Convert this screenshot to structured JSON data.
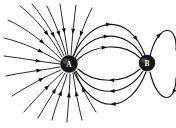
{
  "figure": {
    "background_color": "#ffffff",
    "line_color": "#1a1a1a",
    "width": 176,
    "height": 128
  },
  "charges": [
    {
      "id": "charge-a",
      "label": "A",
      "cx": 69,
      "cy": 64,
      "r": 8.5,
      "fill": "#161616",
      "label_color": "#f2f2f2",
      "polarity": "negative",
      "description": "Left charge; field lines converge inward"
    },
    {
      "id": "charge-b",
      "label": "B",
      "cx": 147,
      "cy": 63,
      "r": 8.0,
      "fill": "#161616",
      "label_color": "#f2f2f2",
      "polarity": "positive",
      "description": "Right charge; field lines emerge and loop back to A"
    }
  ],
  "chart_data": {
    "type": "line",
    "xlabel": "",
    "ylabel": "",
    "xlim": [
      0,
      176
    ],
    "ylim": [
      0,
      128
    ],
    "grid": false,
    "legend": "none",
    "annotations": [
      "A",
      "B"
    ],
    "series": [
      {
        "name": "radial-in-1",
        "group": "radial-to-A",
        "arrow_direction": "toward-A",
        "path": "M 20 6 C 36 18, 52 38, 62 57",
        "arrows": [
          {
            "t": 0.62,
            "dir": "toward-A"
          }
        ]
      },
      {
        "name": "radial-in-2",
        "group": "radial-to-A",
        "arrow_direction": "toward-A",
        "path": "M 32 4 C 44 18, 56 38, 64 56",
        "arrows": [
          {
            "t": 0.66,
            "dir": "toward-A"
          }
        ]
      },
      {
        "name": "radial-in-3",
        "group": "radial-to-A",
        "arrow_direction": "toward-A",
        "path": "M 47 6 C 54 20, 62 40, 66 55",
        "arrows": [
          {
            "t": 0.62,
            "dir": "toward-A"
          }
        ]
      },
      {
        "name": "radial-in-4",
        "group": "radial-to-A",
        "arrow_direction": "toward-A",
        "path": "M 60 4 C 62 20, 66 40, 68 55",
        "arrows": [
          {
            "t": 0.58,
            "dir": "toward-A"
          }
        ]
      },
      {
        "name": "radial-in-5",
        "group": "radial-to-A",
        "arrow_direction": "toward-A",
        "path": "M 76 5 C 74 20, 72 40, 71 55",
        "arrows": [
          {
            "t": 0.58,
            "dir": "toward-A"
          }
        ]
      },
      {
        "name": "radial-in-6",
        "group": "radial-to-A",
        "arrow_direction": "toward-A",
        "path": "M 92 8 C 85 22, 78 40, 74 56",
        "arrows": [
          {
            "t": 0.6,
            "dir": "toward-A"
          }
        ]
      },
      {
        "name": "radial-in-7",
        "group": "radial-to-A",
        "arrow_direction": "toward-A",
        "path": "M 8 20 C 26 28, 46 44, 61 59",
        "arrows": [
          {
            "t": 0.66,
            "dir": "toward-A"
          }
        ]
      },
      {
        "name": "radial-in-8",
        "group": "radial-to-A",
        "arrow_direction": "toward-A",
        "path": "M 4 38 C 22 42, 44 52, 60 62",
        "arrows": [
          {
            "t": 0.68,
            "dir": "toward-A"
          }
        ]
      },
      {
        "name": "radial-in-9",
        "group": "radial-to-A",
        "arrow_direction": "toward-A",
        "path": "M 4 56 C 22 58, 42 62, 60 64",
        "arrows": [
          {
            "t": 0.66,
            "dir": "toward-A"
          }
        ]
      },
      {
        "name": "radial-in-10",
        "group": "radial-to-A",
        "arrow_direction": "toward-A",
        "path": "M 6 76 C 24 72, 44 70, 60 67",
        "arrows": [
          {
            "t": 0.66,
            "dir": "toward-A"
          }
        ]
      },
      {
        "name": "radial-in-11",
        "group": "radial-to-A",
        "arrow_direction": "toward-A",
        "path": "M 12 96 C 28 86, 46 76, 61 70",
        "arrows": [
          {
            "t": 0.66,
            "dir": "toward-A"
          }
        ]
      },
      {
        "name": "radial-in-12",
        "group": "radial-to-A",
        "arrow_direction": "toward-A",
        "path": "M 24 112 C 36 98, 52 82, 63 72",
        "arrows": [
          {
            "t": 0.66,
            "dir": "toward-A"
          }
        ]
      },
      {
        "name": "radial-in-13",
        "group": "radial-to-A",
        "arrow_direction": "toward-A",
        "path": "M 38 118 C 46 104, 58 86, 65 73",
        "arrows": [
          {
            "t": 0.66,
            "dir": "toward-A"
          }
        ]
      },
      {
        "name": "radial-in-14",
        "group": "radial-to-A",
        "arrow_direction": "toward-A",
        "path": "M 52 120 C 56 104, 64 86, 67 74",
        "arrows": [
          {
            "t": 0.64,
            "dir": "toward-A"
          }
        ]
      },
      {
        "name": "radial-in-15",
        "group": "radial-to-A",
        "arrow_direction": "toward-A",
        "path": "M 67 122 C 68 106, 70 88, 70 74",
        "arrows": [
          {
            "t": 0.62,
            "dir": "toward-A"
          }
        ]
      },
      {
        "name": "radial-in-16",
        "group": "radial-to-A",
        "arrow_direction": "toward-A",
        "path": "M 82 120 C 78 104, 75 88, 73 73",
        "arrows": [
          {
            "t": 0.62,
            "dir": "toward-A"
          }
        ]
      },
      {
        "name": "radial-in-17",
        "group": "radial-to-A",
        "arrow_direction": "toward-A",
        "path": "M 96 112 C 88 100, 80 84, 75 71",
        "arrows": [
          {
            "t": 0.62,
            "dir": "toward-A"
          }
        ]
      },
      {
        "name": "arc-upper-outer",
        "group": "A-to-B",
        "arrow_direction": "toward-B",
        "path": "M 73 56 C 92 16, 128 12, 145 55",
        "arrows": [
          {
            "t": 0.52,
            "dir": "toward-B"
          },
          {
            "t": 0.84,
            "dir": "toward-B"
          }
        ]
      },
      {
        "name": "arc-upper-mid",
        "group": "A-to-B",
        "arrow_direction": "toward-B",
        "path": "M 75 58 C 92 30, 126 28, 143 57",
        "arrows": [
          {
            "t": 0.5,
            "dir": "toward-B"
          }
        ]
      },
      {
        "name": "arc-upper-inner",
        "group": "A-to-B",
        "arrow_direction": "toward-B",
        "path": "M 77 60 C 94 44, 124 42, 140 58",
        "arrows": [
          {
            "t": 0.48,
            "dir": "toward-B"
          }
        ]
      },
      {
        "name": "arc-lower-inner",
        "group": "B-to-A",
        "arrow_direction": "toward-A",
        "path": "M 140 69 C 124 84, 94 84, 78 69",
        "arrows": [
          {
            "t": 0.5,
            "dir": "toward-A"
          }
        ]
      },
      {
        "name": "arc-lower-mid",
        "group": "B-to-A",
        "arrow_direction": "toward-A",
        "path": "M 143 71 C 126 98, 92 98, 76 71",
        "arrows": [
          {
            "t": 0.5,
            "dir": "toward-A"
          }
        ]
      },
      {
        "name": "arc-lower-outer",
        "group": "B-to-A",
        "arrow_direction": "toward-A",
        "path": "M 146 72 C 130 114, 94 116, 74 72",
        "arrows": [
          {
            "t": 0.5,
            "dir": "toward-A"
          }
        ]
      },
      {
        "name": "loop-right-top",
        "group": "around-B",
        "arrow_direction": "clockwise",
        "path": "M 150 56 C 158 22, 178 24, 176 50",
        "arrows": [
          {
            "t": 0.46,
            "dir": "right"
          }
        ]
      },
      {
        "name": "loop-right-bottom",
        "group": "around-B",
        "arrow_direction": "clockwise",
        "path": "M 176 78 C 176 104, 158 106, 150 72",
        "arrows": [
          {
            "t": 0.3,
            "dir": "left"
          }
        ]
      }
    ]
  }
}
